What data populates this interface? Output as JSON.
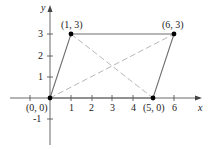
{
  "diagram": {
    "type": "parallelogram-on-coordinate-plane",
    "axes": {
      "x_label": "x",
      "y_label": "y",
      "x_ticks": [
        "1",
        "2",
        "3",
        "4",
        "6"
      ],
      "y_ticks": [
        "-1",
        "1",
        "2",
        "3"
      ]
    },
    "vertices": [
      {
        "label": "(0, 0)",
        "x": 0,
        "y": 0
      },
      {
        "label": "(1, 3)",
        "x": 1,
        "y": 3
      },
      {
        "label": "(6, 3)",
        "x": 6,
        "y": 3
      },
      {
        "label": "(5, 0)",
        "x": 5,
        "y": 0
      }
    ],
    "edges": "solid",
    "diagonals": "dashed",
    "colors": {
      "edge": "#6e6e6e",
      "diagonal": "#b8b8b8",
      "axis": "#444444",
      "point": "#000000"
    }
  }
}
